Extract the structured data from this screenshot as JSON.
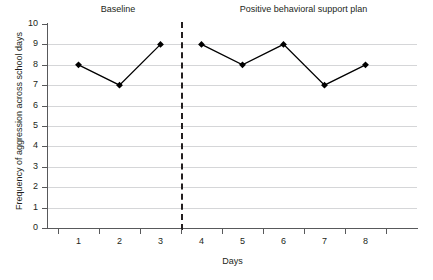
{
  "chart_data": {
    "type": "line",
    "title": "",
    "xlabel": "Days",
    "ylabel": "Frequency of aggression across school days",
    "x": [
      1,
      2,
      3,
      4,
      5,
      6,
      7,
      8
    ],
    "categories": [
      "1",
      "2",
      "3",
      "4",
      "5",
      "6",
      "7",
      "8"
    ],
    "values": [
      8,
      7,
      9,
      9,
      8,
      9,
      7,
      8
    ],
    "series": [
      {
        "name": "Frequency of aggression across school days",
        "values": [
          8,
          7,
          9,
          9,
          8,
          9,
          7,
          8
        ],
        "marker": "diamond",
        "color": "#000000"
      }
    ],
    "ylim": [
      0,
      10
    ],
    "ytick_labels": [
      "0",
      "1",
      "2",
      "3",
      "4",
      "5",
      "6",
      "7",
      "8",
      "9",
      "10"
    ],
    "ytick_values": [
      0,
      1,
      2,
      3,
      4,
      5,
      6,
      7,
      8,
      9,
      10
    ],
    "xtick_labels": [
      "1",
      "2",
      "3",
      "4",
      "5",
      "6",
      "7",
      "8"
    ],
    "grid": "horizontal",
    "legend": "none",
    "phases": [
      {
        "label": "Baseline",
        "days": [
          1,
          2,
          3
        ],
        "values": [
          8,
          7,
          9
        ]
      },
      {
        "label": "Positive behavioral support plan",
        "days": [
          4,
          5,
          6,
          7,
          8
        ],
        "values": [
          9,
          8,
          9,
          7,
          8
        ]
      }
    ],
    "phase_change_line": {
      "between_x": 3.5,
      "style": "dashed",
      "color": "#231f20"
    },
    "colors": {
      "gridline": "#d5d6d8",
      "axis": "#58595b",
      "text": "#231f20",
      "marker": "#000000",
      "background": "#ffffff"
    }
  }
}
